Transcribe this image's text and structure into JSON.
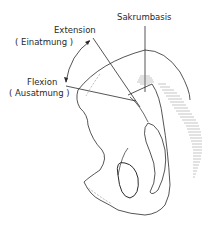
{
  "diagram": {
    "labels": {
      "sakrumbasis": "Sakrumbasis",
      "extension": "Extension",
      "einatmung": "( Einatmung )",
      "flexion": "Flexion",
      "ausatmung": "( Ausatmung )"
    },
    "colors": {
      "line": "#2a2a2a",
      "hatch": "#8a8a8a",
      "background": "#ffffff"
    }
  }
}
